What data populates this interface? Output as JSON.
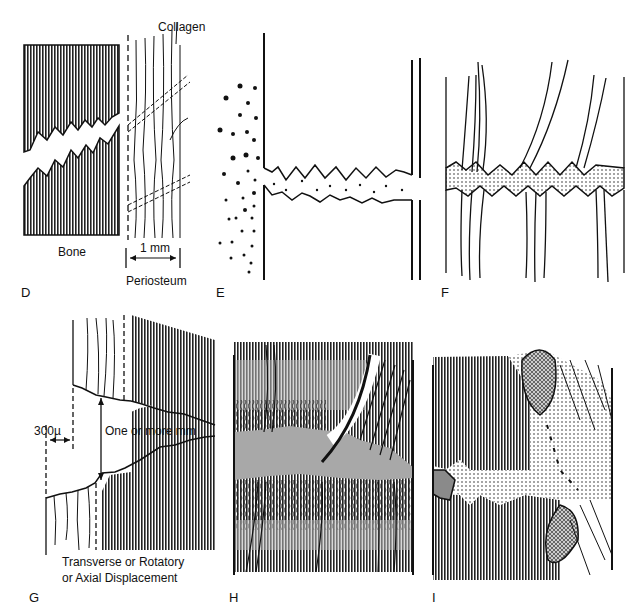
{
  "figure": {
    "panels": [
      {
        "id": "D",
        "label": "D",
        "annotations": {
          "collagen": "Collagen",
          "bone": "Bone",
          "scale": "1 mm",
          "periosteum": "Periosteum"
        }
      },
      {
        "id": "E",
        "label": "E"
      },
      {
        "id": "F",
        "label": "F"
      },
      {
        "id": "G",
        "label": "G",
        "annotations": {
          "gap": "300µ",
          "distance": "One or more mm",
          "caption_line1": "Transverse or Rotatory",
          "caption_line2": "or Axial Displacement"
        }
      },
      {
        "id": "H",
        "label": "H"
      },
      {
        "id": "I",
        "label": "I"
      }
    ],
    "colors": {
      "ink": "#111111",
      "gray_fill": "#a8a8a8",
      "background": "#ffffff"
    }
  }
}
